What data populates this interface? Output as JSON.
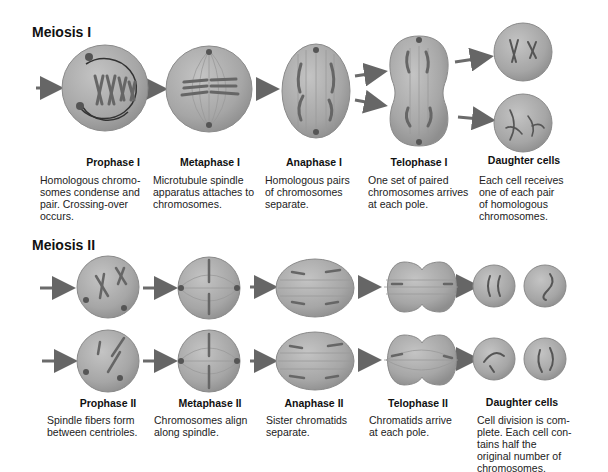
{
  "meiosis_i": {
    "title": "Meiosis I",
    "stages": [
      {
        "label": "Prophase I",
        "description": [
          "Homologous chromo-",
          "somes condense and",
          "pair. Crossing-over",
          "occurs."
        ]
      },
      {
        "label": "Metaphase I",
        "description": [
          "Microtubule spindle",
          "apparatus attaches to",
          "chromosomes."
        ]
      },
      {
        "label": "Anaphase I",
        "description": [
          "Homologous pairs",
          "of chromosomes",
          "separate."
        ]
      },
      {
        "label": "Telophase I",
        "description": [
          "One set of paired",
          "chromosomes arrives",
          "at each pole."
        ]
      },
      {
        "label": "Daughter cells",
        "description": [
          "Each cell receives",
          "one of each pair",
          "of homologous",
          "chromosomes."
        ]
      }
    ]
  },
  "meiosis_ii": {
    "title": "Meiosis II",
    "stages": [
      {
        "label": "Prophase II",
        "description": [
          "Spindle fibers form",
          "between centrioles."
        ]
      },
      {
        "label": "Metaphase II",
        "description": [
          "Chromosomes align",
          "along spindle."
        ]
      },
      {
        "label": "Anaphase II",
        "description": [
          "Sister chromatids",
          "separate."
        ]
      },
      {
        "label": "Telophase II",
        "description": [
          "Chromatids arrive",
          "at each pole."
        ]
      },
      {
        "label": "Daughter cells",
        "description": [
          "Cell division is com-",
          "plete. Each cell con-",
          "tains half the",
          "original number of",
          "chromosomes."
        ]
      }
    ]
  },
  "colors": {
    "cell_fill": "#a9a9a9",
    "cell_edge": "#8a8a8a",
    "arrow": "#6b6b6b",
    "chromosome": "#5a5a5a"
  }
}
